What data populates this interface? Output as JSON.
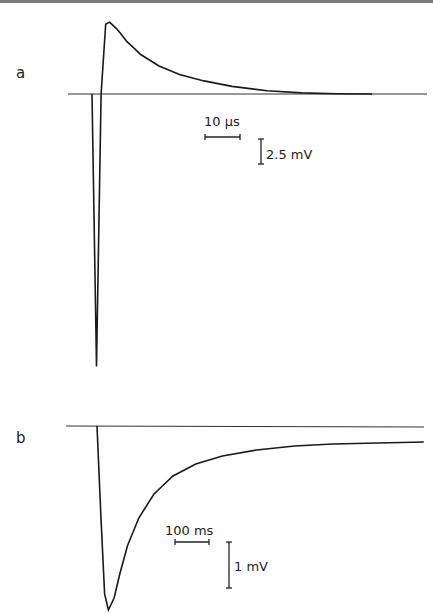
{
  "figure": {
    "panels": [
      {
        "label": "a",
        "time_scale": "10 µs",
        "voltage_scale": "2.5 mV",
        "description": "biphasic transient: sharp negative deflection then positive peak decaying to baseline"
      },
      {
        "label": "b",
        "time_scale": "100 ms",
        "voltage_scale": "1 mV",
        "description": "negative deflection recovering slowly toward baseline"
      }
    ]
  },
  "chart_data": [
    {
      "type": "line",
      "title": "a",
      "xlabel": "",
      "ylabel": "",
      "scale_bars": {
        "time": "10 µs",
        "voltage": "2.5 mV"
      },
      "units": {
        "x": "µs",
        "y": "mV"
      },
      "series": [
        {
          "name": "trace-a",
          "x": [
            0,
            1.3,
            2.6,
            3.9,
            5,
            7,
            10,
            14,
            19,
            25,
            32,
            40,
            50,
            60,
            70,
            80
          ],
          "y": [
            0,
            -25,
            0,
            6.4,
            6.6,
            6.0,
            4.8,
            3.6,
            2.6,
            1.8,
            1.2,
            0.7,
            0.3,
            0.1,
            0.02,
            0.0
          ]
        }
      ],
      "baseline": 0
    },
    {
      "type": "line",
      "title": "b",
      "xlabel": "",
      "ylabel": "",
      "scale_bars": {
        "time": "100 ms",
        "voltage": "1 mV"
      },
      "units": {
        "x": "ms",
        "y": "mV"
      },
      "series": [
        {
          "name": "trace-b",
          "x": [
            0,
            10,
            20,
            30,
            45,
            60,
            80,
            110,
            150,
            200,
            260,
            330,
            420,
            520,
            620,
            860
          ],
          "y": [
            0,
            -2.2,
            -4.2,
            -4.6,
            -4.3,
            -3.7,
            -3.0,
            -2.3,
            -1.7,
            -1.25,
            -0.95,
            -0.75,
            -0.6,
            -0.5,
            -0.45,
            -0.4
          ]
        }
      ],
      "baseline": 0
    }
  ]
}
